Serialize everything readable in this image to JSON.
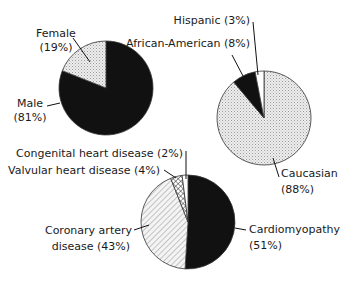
{
  "chart_data": [
    {
      "type": "pie",
      "title": "Gender",
      "slices": [
        {
          "label": "Male",
          "value": 81,
          "pct_label": "(81%)",
          "fill": "solid-black"
        },
        {
          "label": "Female",
          "value": 19,
          "pct_label": "(19%)",
          "fill": "light-dots"
        }
      ]
    },
    {
      "type": "pie",
      "title": "Race",
      "slices": [
        {
          "label": "Caucasian",
          "value": 88,
          "pct_label": "(88%)",
          "fill": "light-dots"
        },
        {
          "label": "African-American",
          "value": 8,
          "pct_label": "(8%)",
          "fill": "solid-black"
        },
        {
          "label": "Hispanic",
          "value": 3,
          "pct_label": "(3%)",
          "fill": "white"
        }
      ]
    },
    {
      "type": "pie",
      "title": "Etiology",
      "slices": [
        {
          "label": "Cardiomyopathy",
          "value": 51,
          "pct_label": "(51%)",
          "fill": "solid-black"
        },
        {
          "label": "Coronary artery disease",
          "value": 43,
          "pct_label": "(43%)",
          "fill": "diagonal-hatch"
        },
        {
          "label": "Valvular heart disease",
          "value": 4,
          "pct_label": "(4%)",
          "fill": "crosshatch"
        },
        {
          "label": "Congenital heart disease",
          "value": 2,
          "pct_label": "(2%)",
          "fill": "white"
        }
      ]
    }
  ],
  "labels": {
    "female_1": "Female",
    "female_2": "(19%)",
    "male_1": "Male",
    "male_2": "(81%)",
    "hispanic": "Hispanic (3%)",
    "african_american": "African-American (8%)",
    "caucasian_1": "Caucasian",
    "caucasian_2": "(88%)",
    "congenital": "Congenital heart disease (2%)",
    "valvular": "Valvular heart disease (4%)",
    "coronary_1": "Coronary artery",
    "coronary_2": "disease (43%)",
    "cardiomyopathy_1": "Cardiomyopathy",
    "cardiomyopathy_2": "(51%)"
  },
  "colors": {
    "black": "#111111",
    "dots_bg": "#eeeeee",
    "dots_fg": "#9a9a9a",
    "hatch": "#777777",
    "white": "#ffffff",
    "outline": "#333333"
  }
}
